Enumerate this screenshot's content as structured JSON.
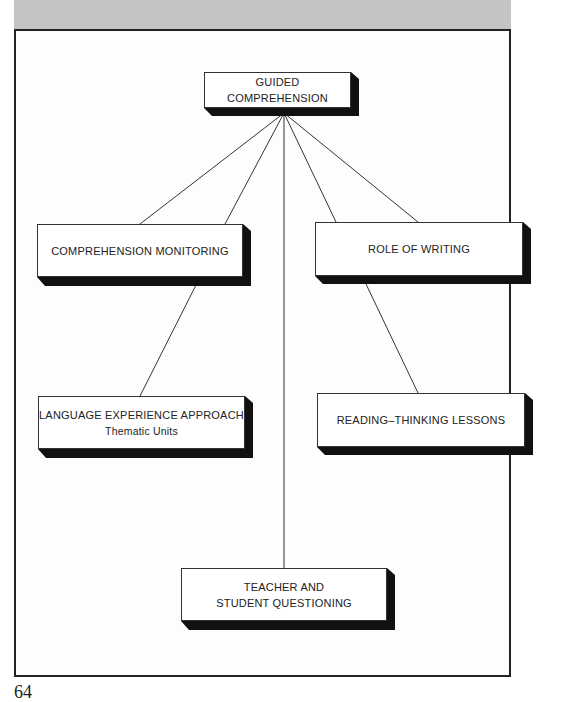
{
  "header_band": {
    "color": "#c4c4c4"
  },
  "diagram": {
    "root": {
      "id": "guided",
      "label": "GUIDED COMPREHENSION"
    },
    "nodes": [
      {
        "id": "monitoring",
        "label": "COMPREHENSION MONITORING",
        "subtitle": ""
      },
      {
        "id": "writing",
        "label": "ROLE OF WRITING",
        "subtitle": ""
      },
      {
        "id": "lea",
        "label": "LANGUAGE EXPERIENCE APPROACH",
        "subtitle": "Thematic Units"
      },
      {
        "id": "reading",
        "label": "READING–THINKING LESSONS",
        "subtitle": ""
      },
      {
        "id": "questioning",
        "label_line1": "TEACHER AND",
        "label_line2": "STUDENT QUESTIONING"
      }
    ],
    "edges": [
      [
        "guided",
        "monitoring"
      ],
      [
        "guided",
        "monitoring"
      ],
      [
        "guided",
        "writing"
      ],
      [
        "guided",
        "writing"
      ],
      [
        "guided",
        "questioning"
      ],
      [
        "monitoring",
        "lea"
      ],
      [
        "writing",
        "reading"
      ]
    ]
  },
  "page_number": "64"
}
